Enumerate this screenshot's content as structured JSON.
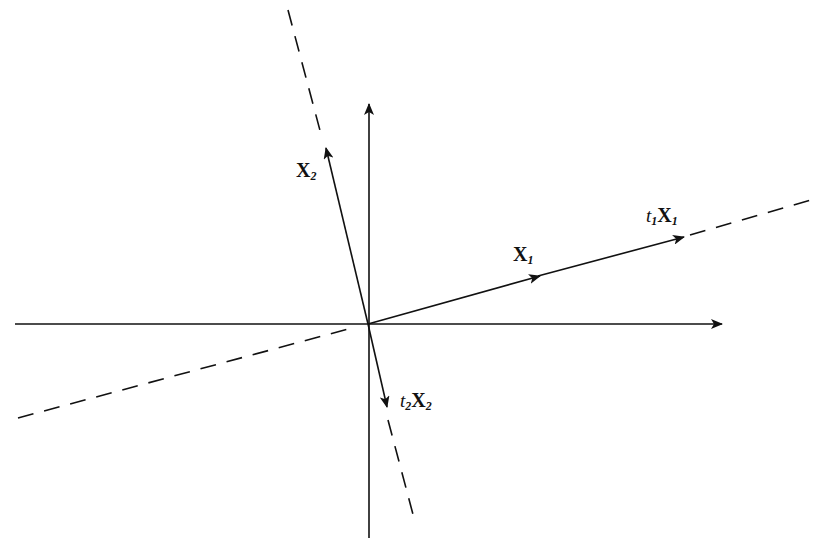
{
  "diagram": {
    "type": "vector-diagram",
    "origin": [
      368,
      324
    ],
    "colors": {
      "stroke": "#111111",
      "background": "#ffffff"
    },
    "labels": {
      "x2": {
        "main": "X",
        "sub": "2"
      },
      "x1": {
        "main": "X",
        "sub": "1"
      },
      "t1x1": {
        "coef": "t",
        "coef_sub": "1",
        "main": "X",
        "sub": "1"
      },
      "t2x2": {
        "coef": "t",
        "coef_sub": "2",
        "main": "X",
        "sub": "2"
      }
    }
  }
}
